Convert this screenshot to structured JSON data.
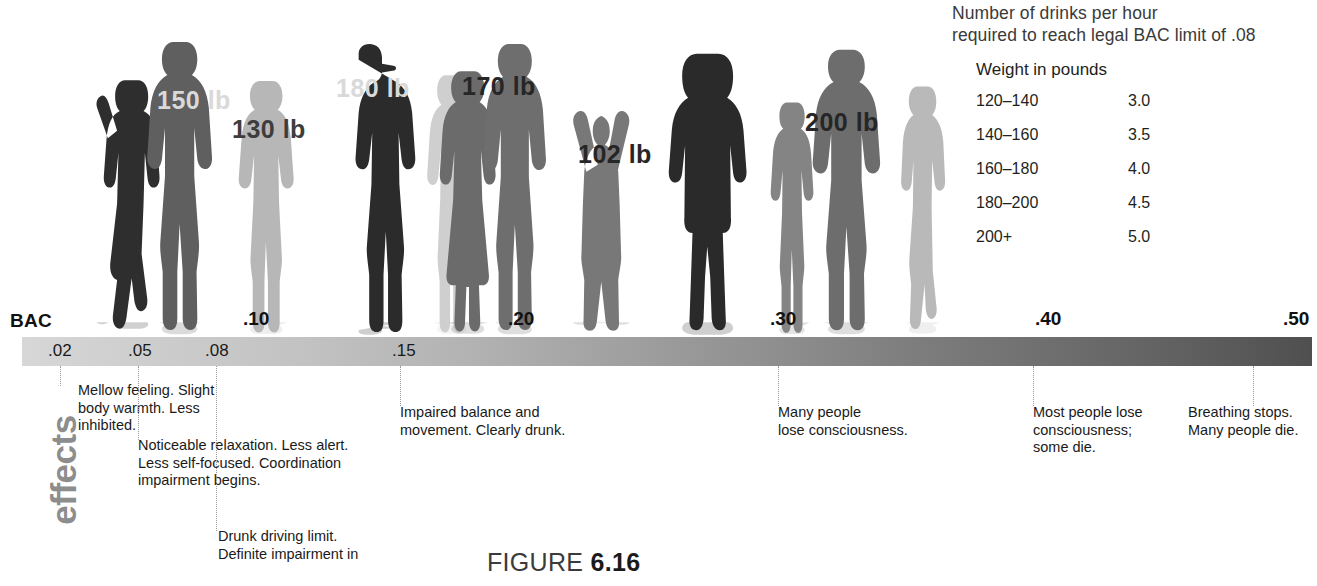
{
  "figure": {
    "caption_word": "FIGURE",
    "caption_number": "6.16"
  },
  "drinks_panel": {
    "title_line1": "Number of drinks per hour",
    "title_line2": "required to reach legal BAC limit of .08",
    "weight_header": "Weight in pounds",
    "rows": [
      {
        "range": "120–140",
        "drinks": "3.0"
      },
      {
        "range": "140–160",
        "drinks": "3.5"
      },
      {
        "range": "160–180",
        "drinks": "4.0"
      },
      {
        "range": "180–200",
        "drinks": "4.5"
      },
      {
        "range": "200+",
        "drinks": "5.0"
      }
    ]
  },
  "scale": {
    "axis_label": "BAC",
    "minor_ticks": [
      {
        "label": ".02",
        "x": 48
      },
      {
        "label": ".05",
        "x": 128
      },
      {
        "label": ".08",
        "x": 205
      },
      {
        "label": ".15",
        "x": 392
      }
    ],
    "major_ticks": [
      {
        "label": ".10",
        "x": 243
      },
      {
        "label": ".20",
        "x": 508
      },
      {
        "label": ".30",
        "x": 770
      },
      {
        "label": ".40",
        "x": 1035
      },
      {
        "label": ".50",
        "x": 1283
      }
    ]
  },
  "effects": {
    "side_label": "effects",
    "notes": [
      {
        "x": 78,
        "y": 382,
        "leader_x": 60,
        "leader_h": 20,
        "lines": [
          "Mellow feeling. Slight",
          "body warmth. Less",
          "inhibited."
        ]
      },
      {
        "x": 138,
        "y": 437,
        "leader_x": 138,
        "leader_h": 74,
        "lines": [
          "Noticeable relaxation. Less alert.",
          "Less self-focused. Coordination",
          "impairment begins."
        ]
      },
      {
        "x": 218,
        "y": 528,
        "leader_x": 216,
        "leader_h": 165,
        "lines": [
          "Drunk driving limit.",
          "Definite impairment in"
        ]
      },
      {
        "x": 400,
        "y": 404,
        "leader_x": 400,
        "leader_h": 40,
        "lines": [
          "Impaired balance and",
          "movement. Clearly drunk."
        ]
      },
      {
        "x": 778,
        "y": 404,
        "leader_x": 778,
        "leader_h": 40,
        "lines": [
          "Many people",
          "lose consciousness."
        ]
      },
      {
        "x": 1033,
        "y": 404,
        "leader_x": 1033,
        "leader_h": 40,
        "lines": [
          "Most people lose",
          "consciousness;",
          "some die."
        ]
      },
      {
        "x": 1188,
        "y": 404,
        "leader_x": 1253,
        "leader_h": 40,
        "lines": [
          "Breathing stops.",
          "Many people die."
        ]
      }
    ]
  },
  "silhouettes": {
    "weight_tags": [
      {
        "label": "150 lb",
        "x": 157,
        "y": 86,
        "tone": "light"
      },
      {
        "label": "130 lb",
        "x": 232,
        "y": 115,
        "tone": "dark"
      },
      {
        "label": "180 lb",
        "x": 336,
        "y": 74,
        "tone": "light"
      },
      {
        "label": "170 lb",
        "x": 462,
        "y": 72,
        "tone": "mid"
      },
      {
        "label": "102 lb",
        "x": 578,
        "y": 140,
        "tone": "mid"
      },
      {
        "label": "200 lb",
        "x": 805,
        "y": 108,
        "tone": "mid"
      }
    ],
    "people": [
      {
        "name": "person-leaning-woman",
        "x": 88,
        "w": 86,
        "h": 280,
        "tone": "#2e2e2e",
        "pose": "lean"
      },
      {
        "name": "person-leaning-man",
        "x": 135,
        "w": 100,
        "h": 300,
        "tone": "#5f5f5f",
        "pose": "standA"
      },
      {
        "name": "person-woman-130",
        "x": 225,
        "w": 90,
        "h": 262,
        "tone": "#b7b7b7",
        "pose": "standB"
      },
      {
        "name": "person-man-180",
        "x": 330,
        "w": 98,
        "h": 296,
        "tone": "#2b2b2b",
        "pose": "cap"
      },
      {
        "name": "person-woman-side",
        "x": 415,
        "w": 80,
        "h": 268,
        "tone": "#cfcfcf",
        "pose": "standB"
      },
      {
        "name": "person-woman-dress",
        "x": 428,
        "w": 86,
        "h": 272,
        "tone": "#6b6b6b",
        "pose": "dress"
      },
      {
        "name": "person-man-170",
        "x": 472,
        "w": 96,
        "h": 298,
        "tone": "#6e6e6e",
        "pose": "standA"
      },
      {
        "name": "person-woman-arms-up",
        "x": 568,
        "w": 92,
        "h": 262,
        "tone": "#787878",
        "pose": "armsup"
      },
      {
        "name": "person-man-shorts",
        "x": 660,
        "w": 96,
        "h": 286,
        "tone": "#2a2a2a",
        "pose": "shorts"
      },
      {
        "name": "person-woman-small",
        "x": 760,
        "w": 70,
        "h": 240,
        "tone": "#848484",
        "pose": "standB"
      },
      {
        "name": "person-man-200",
        "x": 800,
        "w": 104,
        "h": 292,
        "tone": "#6d6d6d",
        "pose": "standA"
      },
      {
        "name": "person-woman-light",
        "x": 886,
        "w": 76,
        "h": 258,
        "tone": "#b9b9b9",
        "pose": "lean2"
      }
    ]
  }
}
